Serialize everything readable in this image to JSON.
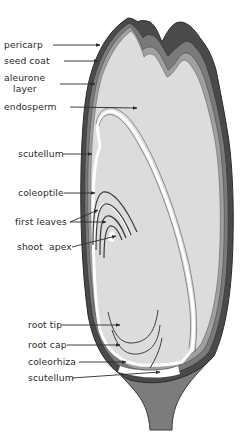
{
  "diagram": {
    "colors": {
      "background": "#ffffff",
      "endosperm_fill": "#dcdcdc",
      "coat_dark": "#3a3a3a",
      "coat_mid": "#6e6e6e",
      "stalk_fill": "#7c7c7c",
      "text": "#2a2a2a",
      "embryo_outline": "#ffffff"
    },
    "labels": [
      {
        "id": "pericarp",
        "text": "pericarp",
        "x": 4,
        "y": 40,
        "arrow_to": [
          100,
          45
        ]
      },
      {
        "id": "seed-coat",
        "text": "seed coat",
        "x": 4,
        "y": 56,
        "arrow_to": [
          98,
          61
        ]
      },
      {
        "id": "aleurone-layer",
        "text_line1": "aleurone",
        "text_line2": "layer",
        "x": 4,
        "y": 73,
        "arrow_to": [
          95,
          84
        ]
      },
      {
        "id": "endosperm",
        "text": "endosperm",
        "x": 4,
        "y": 101,
        "arrow_to": [
          137,
          108
        ]
      },
      {
        "id": "scutellum-top",
        "text": "scutellum",
        "x": 18,
        "y": 149,
        "arrow_to": [
          92,
          154
        ]
      },
      {
        "id": "coleoptile",
        "text": "coleoptile",
        "x": 18,
        "y": 188,
        "arrow_to": [
          95,
          193
        ]
      },
      {
        "id": "first-leaves",
        "text": "first leaves",
        "x": 15,
        "y": 217,
        "arrow_to": [
          [
            98,
            210
          ],
          [
            106,
            222
          ]
        ]
      },
      {
        "id": "shoot-apex",
        "text": "shoot  apex",
        "x": 17,
        "y": 242,
        "arrow_to": [
          116,
          236
        ]
      },
      {
        "id": "root-tip",
        "text": "root tip",
        "x": 28,
        "y": 320,
        "arrow_to": [
          120,
          325
        ]
      },
      {
        "id": "root-cap",
        "text": "root cap",
        "x": 28,
        "y": 340,
        "arrow_to": [
          120,
          345
        ]
      },
      {
        "id": "coleorhiza",
        "text": "coleorhiza",
        "x": 28,
        "y": 358,
        "arrow_to": [
          126,
          362
        ]
      },
      {
        "id": "scutellum-bottom",
        "text": "scutellum",
        "x": 28,
        "y": 374,
        "arrow_to": [
          160,
          372
        ]
      }
    ]
  }
}
